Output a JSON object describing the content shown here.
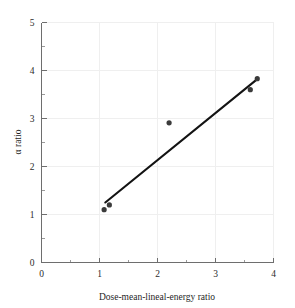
{
  "chart_data": {
    "type": "scatter",
    "title": "",
    "xlabel": "Dose-mean-lineal-energy ratio",
    "ylabel": "α ratio",
    "xlim": [
      0,
      4
    ],
    "ylim": [
      0,
      5
    ],
    "grid": true,
    "legend": null,
    "xticks": [
      0,
      1,
      2,
      3,
      4
    ],
    "yticks": [
      0,
      1,
      2,
      3,
      4,
      5
    ],
    "xtick_labels": [
      "0",
      "1",
      "2",
      "3",
      "4"
    ],
    "ytick_labels": [
      "0",
      "1",
      "2",
      "3",
      "4",
      "5"
    ],
    "xminor_ticks": [
      0.5,
      1.5,
      2.5,
      3.5
    ],
    "yminor_ticks": [
      0.5,
      1.5,
      2.5,
      3.5,
      4.5
    ],
    "series": [
      {
        "name": "data points",
        "marker": "filled-circle",
        "color": "#3b3b3b",
        "points": [
          {
            "x": 1.08,
            "y": 1.1
          },
          {
            "x": 1.17,
            "y": 1.2
          },
          {
            "x": 2.2,
            "y": 2.91
          },
          {
            "x": 3.6,
            "y": 3.6
          },
          {
            "x": 3.72,
            "y": 3.83
          }
        ]
      },
      {
        "name": "fitted line",
        "marker": "none",
        "color": "#131313",
        "line_from": {
          "x": 1.1,
          "y": 1.25
        },
        "line_to": {
          "x": 3.72,
          "y": 3.82
        }
      }
    ]
  },
  "axes": {
    "x_title": "Dose-mean-lineal-energy ratio",
    "y_title": "α ratio"
  },
  "colors": {
    "axis": "#6e6e6e",
    "grid": "#efefef",
    "marker": "#3b3b3b",
    "line": "#131313",
    "background": "#ffffff",
    "text": "#1f1f1f"
  }
}
